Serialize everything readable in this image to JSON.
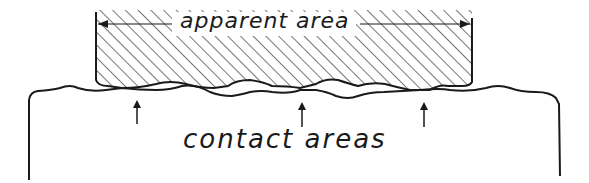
{
  "diagram": {
    "labels": {
      "apparent_area": "apparent area",
      "contact_areas": "contact areas"
    },
    "elements": {
      "upper_block": "hatched upper body (apparent area)",
      "lower_body": "lower surface body",
      "arrows_count": 3
    },
    "colors": {
      "ink": "#1a1a1a",
      "background": "#ffffff"
    }
  }
}
